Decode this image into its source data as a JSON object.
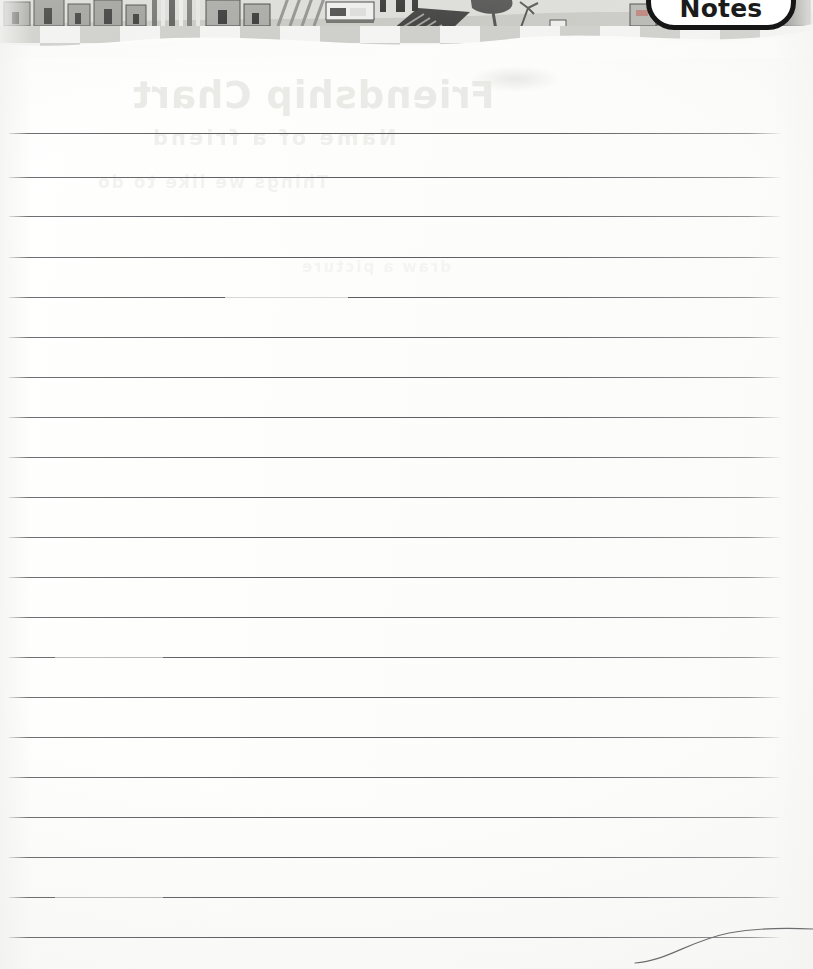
{
  "page": {
    "kind": "lined-notes-page",
    "title_tab": "Notes",
    "paper_color": "#fdfdfc",
    "rule_color": "#5c5c60",
    "rule_count": 21,
    "rule_spacing_px": 40,
    "rule_left_px": 9,
    "rule_right_px": 780,
    "rule_y_positions": [
      133,
      177,
      216,
      257,
      297,
      337,
      377,
      417,
      457,
      497,
      537,
      577,
      617,
      657,
      697,
      737,
      777,
      817,
      857,
      897,
      937
    ],
    "rule_faded": [
      4,
      13,
      19
    ]
  },
  "tab": {
    "label": "Notes",
    "text_color": "#1b1b1b",
    "fill_color": "#ffffff",
    "outline_color": "#161616"
  },
  "banner": {
    "description": "village illustration band",
    "sky_color": "#d9d9d5",
    "ground_color": "#c9c9c4",
    "checker_light": "#f2f2f0",
    "checker_dark": "#cfcfcb",
    "ink_color": "#3a3a38",
    "scene_items": [
      "row-houses",
      "striped-fence",
      "tree",
      "garden-plot",
      "church",
      "shed",
      "market-stall",
      "figures"
    ]
  },
  "ghost_text": {
    "note": "faint show-through from reverse side of sheet (mirrored, illegible)",
    "title": "Friendship Chart",
    "subtitle": "Name of a friend",
    "line3": "Things we like to do",
    "line4": "draw a picture"
  },
  "curl": {
    "description": "page corner curl arc at bottom right",
    "stroke_color": "#6d6d70"
  }
}
